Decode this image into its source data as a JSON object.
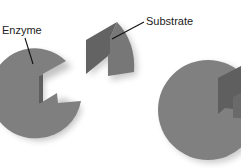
{
  "labels": {
    "enzyme": "Enzyme",
    "substrate": "Substrate"
  },
  "colors": {
    "background": "#ffffff",
    "enzyme_fill": "#7d7d7d",
    "enzyme_dark": "#5f5f5f",
    "substrate_fill": "#666666",
    "substrate_light": "#777777",
    "leader_line": "#111111",
    "text": "#222222"
  }
}
